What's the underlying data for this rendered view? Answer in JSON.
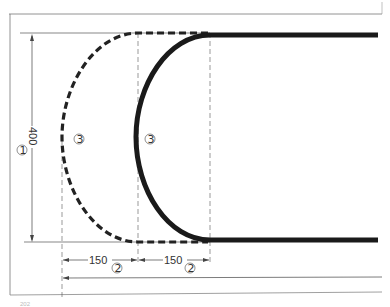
{
  "diagram": {
    "type": "track-curve-dimension-drawing",
    "dimensions": {
      "height": "400",
      "offset_left": "150",
      "offset_right": "150"
    },
    "markers": {
      "height_marker": "①",
      "offset_marker_left": "②",
      "offset_marker_right": "②",
      "curve_marker_dashed": "③",
      "curve_marker_solid": "③"
    },
    "colors": {
      "line": "#222222",
      "thin_line": "#555555",
      "background": "#ffffff"
    }
  }
}
